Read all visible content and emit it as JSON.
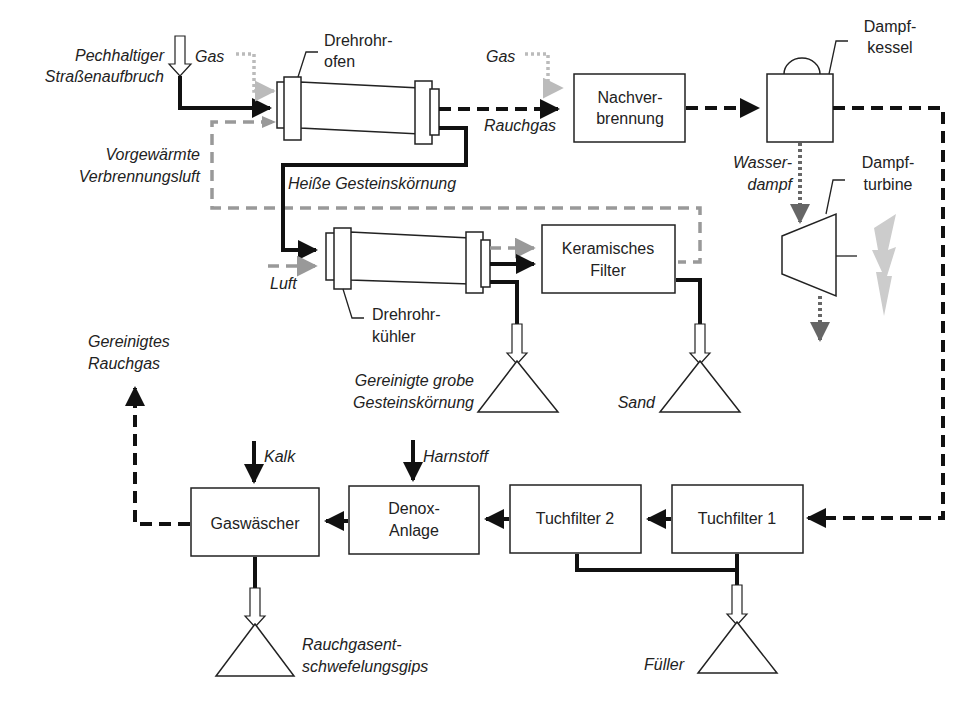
{
  "diagram": {
    "units": {
      "drehrohrofen": {
        "label_line1": "Drehrohr-",
        "label_line2": "ofen"
      },
      "drehrohrkuehler": {
        "label_line1": "Drehrohr-",
        "label_line2": "kühler"
      },
      "nachverbrennung": {
        "label_line1": "Nachver-",
        "label_line2": "brennung"
      },
      "dampfkessel": {
        "label_line1": "Dampf-",
        "label_line2": "kessel"
      },
      "dampfturbine": {
        "label_line1": "Dampf-",
        "label_line2": "turbine"
      },
      "keramisches_filter": {
        "label_line1": "Keramisches",
        "label_line2": "Filter"
      },
      "tuchfilter1": {
        "label": "Tuchfilter 1"
      },
      "tuchfilter2": {
        "label": "Tuchfilter 2"
      },
      "denox": {
        "label_line1": "Denox-",
        "label_line2": "Anlage"
      },
      "gaswaescher": {
        "label": "Gaswäscher"
      }
    },
    "streams": {
      "input_material": {
        "line1": "Pechhaltiger",
        "line2": "Straßenaufbruch"
      },
      "gas_oven": "Gas",
      "gas_nachverbrennung": "Gas",
      "preheated_air": {
        "line1": "Vorgewärmte",
        "line2": "Verbrennungsluft"
      },
      "hot_aggregate": "Heiße Gesteinskörnung",
      "flue_gas": "Rauchgas",
      "air": "Luft",
      "steam": {
        "line1": "Wasser-",
        "line2": "dampf"
      },
      "lime": "Kalk",
      "urea": "Harnstoff",
      "clean_flue_gas": {
        "line1": "Gereinigtes",
        "line2": "Rauchgas"
      }
    },
    "products": {
      "coarse_aggregate": {
        "line1": "Gereinigte grobe",
        "line2": "Gesteinskörnung"
      },
      "sand": "Sand",
      "filler": "Füller",
      "gypsum": {
        "line1": "Rauchgasent-",
        "line2": "schwefelungsgips"
      }
    },
    "colors": {
      "solid_line": "#111111",
      "dashed_gas": "#111111",
      "preheated_air": "#999999",
      "steam": "#666666",
      "fuel_gas": "#bbbbbb",
      "electricity": "#cccccc"
    }
  }
}
